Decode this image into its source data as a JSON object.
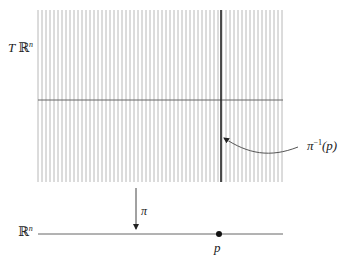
{
  "diagram": {
    "labels": {
      "total_space": {
        "prefix": "T ",
        "bb": "ℝ",
        "exp": "n"
      },
      "base_space": {
        "bb": "ℝ",
        "exp": "n"
      },
      "projection": "π",
      "point": "p",
      "fiber": {
        "base": "π",
        "exp": "−1",
        "arg": "(p)"
      }
    },
    "grid": {
      "x_start": 38,
      "x_end": 283,
      "y_top": 10,
      "y_bottom": 182,
      "line_spacing": 4,
      "zero_section_y": 100,
      "line_color": "#b8b8b8",
      "fiber_color": "#222222"
    },
    "base_line": {
      "y": 234,
      "x_start": 38,
      "x_end": 283
    },
    "point_p_x": 219,
    "projection_arrow": {
      "x": 136,
      "y_top": 188,
      "y_bottom": 230
    }
  }
}
